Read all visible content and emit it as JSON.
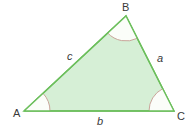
{
  "diagram": {
    "type": "triangle",
    "colors": {
      "fill": "#d6efd6",
      "stroke": "#6cbf5c",
      "angle_arc": "#c9a59a",
      "label": "#3a3a3a",
      "background": "#ffffff"
    },
    "vertices": [
      {
        "name": "A",
        "x": 24,
        "y": 111
      },
      {
        "name": "B",
        "x": 126,
        "y": 16
      },
      {
        "name": "C",
        "x": 174,
        "y": 111
      }
    ],
    "vertex_labels": {
      "A": "A",
      "B": "B",
      "C": "C"
    },
    "side_labels": {
      "a": "a",
      "b": "b",
      "c": "c"
    },
    "angle_marks": [
      "A",
      "B",
      "C"
    ]
  }
}
